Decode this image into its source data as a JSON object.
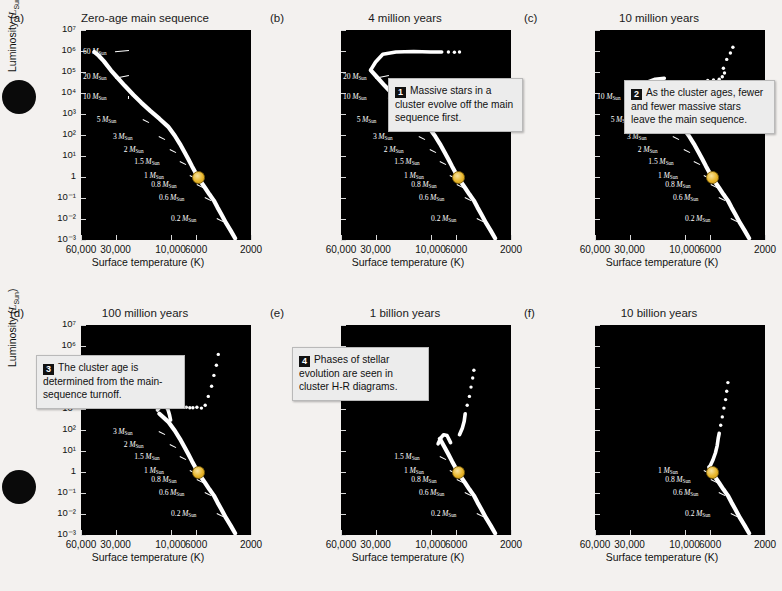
{
  "figure": {
    "axis": {
      "ylabel": "Luminosity (L_Sun)",
      "ylabel_main": "Luminosity (",
      "ylabel_italic": "L",
      "ylabel_sub": "Sun",
      "ylabel_end": ")",
      "xlabel": "Surface temperature (K)",
      "yticks": [
        "10⁷",
        "10⁶",
        "10⁵",
        "10⁴",
        "10³",
        "10²",
        "10¹",
        "1",
        "10⁻¹",
        "10⁻²",
        "10⁻³"
      ],
      "ytick_values": [
        10000000.0,
        1000000.0,
        100000.0,
        10000.0,
        1000.0,
        100.0,
        10,
        1,
        0.1,
        0.01,
        0.001
      ],
      "xticks": [
        "60,000",
        "30,000",
        "10,000",
        "6000",
        "2000"
      ],
      "xtick_values": [
        60000,
        30000,
        10000,
        6000,
        2000
      ],
      "ylim": [
        0.001,
        10000000
      ],
      "xlim": [
        60000,
        2000
      ],
      "xscale": "log-reversed",
      "yscale": "log"
    },
    "panels": [
      {
        "tag": "(a)",
        "title": "Zero-age main sequence",
        "masses": [
          "60",
          "20",
          "10",
          "5",
          "3",
          "2",
          "1.5",
          "1",
          "0.8",
          "0.6",
          "0.2"
        ],
        "has_sun": true,
        "callout": null
      },
      {
        "tag": "(b)",
        "title": "4 million years",
        "masses": [
          "20",
          "10",
          "5",
          "3",
          "2",
          "1.5",
          "1",
          "0.8",
          "0.6",
          "0.2"
        ],
        "has_sun": true,
        "callout": {
          "number": "1",
          "text": "Massive stars in a cluster evolve off the main sequence first."
        }
      },
      {
        "tag": "(c)",
        "title": "10 million years",
        "masses": [
          "10",
          "5",
          "3",
          "2",
          "1.5",
          "1",
          "0.8",
          "0.6",
          "0.2"
        ],
        "has_sun": true,
        "callout": {
          "number": "2",
          "text": "As the cluster ages, fewer and fewer massive stars leave the main sequence."
        }
      },
      {
        "tag": "(d)",
        "title": "100 million years",
        "masses": [
          "3",
          "2",
          "1.5",
          "1",
          "0.8",
          "0.6",
          "0.2"
        ],
        "has_sun": true,
        "callout": {
          "number": "3",
          "text": "The cluster age is determined from the main-sequence turnoff."
        }
      },
      {
        "tag": "(e)",
        "title": "1 billion years",
        "masses": [
          "1.5",
          "1",
          "0.8",
          "0.6",
          "0.2"
        ],
        "has_sun": true,
        "callout": {
          "number": "4",
          "text": "Phases of stellar evolution are seen in cluster H-R diagrams."
        }
      },
      {
        "tag": "(f)",
        "title": "10 billion years",
        "masses": [
          "1",
          "0.8",
          "0.6",
          "0.2"
        ],
        "has_sun": true,
        "callout": null
      }
    ],
    "mass_unit_symbol": "M",
    "mass_unit_sub": "Sun",
    "colors": {
      "plot_background": "#000000",
      "track": "#ffffff",
      "sun_marker": "#e8b62c",
      "page_background": "#f3f1ef",
      "callout_background": "#ececec"
    }
  },
  "chart_data": {
    "type": "line",
    "xlabel": "Surface temperature (K)",
    "ylabel": "Luminosity (L_Sun)",
    "xlim": [
      60000,
      2000
    ],
    "ylim": [
      0.001,
      10000000
    ],
    "xscale": "log-reversed",
    "yscale": "log",
    "grid": false,
    "legend": "none",
    "series": [
      {
        "name": "(a) Zero-age main sequence",
        "points_temp_lum": [
          [
            45000,
            800000
          ],
          [
            40000,
            500000
          ],
          [
            33000,
            90000
          ],
          [
            25000,
            20000
          ],
          [
            18000,
            4000
          ],
          [
            12000,
            600
          ],
          [
            9000,
            80
          ],
          [
            7500,
            20
          ],
          [
            6800,
            5
          ],
          [
            5800,
            1
          ],
          [
            5000,
            0.35
          ],
          [
            4200,
            0.08
          ],
          [
            3400,
            0.01
          ],
          [
            2800,
            0.0015
          ]
        ],
        "mass_labels": [
          {
            "mass": "60",
            "temp": 44000,
            "lum": 700000
          },
          {
            "mass": "20",
            "temp": 33000,
            "lum": 45000
          },
          {
            "mass": "10",
            "temp": 24000,
            "lum": 6000
          },
          {
            "mass": "5",
            "temp": 16000,
            "lum": 500
          },
          {
            "mass": "3",
            "temp": 11500,
            "lum": 70
          },
          {
            "mass": "2",
            "temp": 9000,
            "lum": 16
          },
          {
            "mass": "1.5",
            "temp": 7200,
            "lum": 5
          },
          {
            "mass": "1",
            "temp": 5800,
            "lum": 1
          },
          {
            "mass": "0.8",
            "temp": 5000,
            "lum": 0.35
          },
          {
            "mass": "0.6",
            "temp": 4200,
            "lum": 0.08
          },
          {
            "mass": "0.2",
            "temp": 3300,
            "lum": 0.008
          }
        ],
        "sun": {
          "temp": 5800,
          "lum": 1
        }
      },
      {
        "name": "(b) 4 million years",
        "turnoff_mass": 60,
        "note": "Massive stars evolve off main sequence; supergiant branch extends redward at L~1e6"
      },
      {
        "name": "(c) 10 million years",
        "turnoff_mass": 20,
        "note": "Turnoff at 20 M_Sun; red supergiants populate upper right"
      },
      {
        "name": "(d) 100 million years",
        "turnoff_mass": 5,
        "note": "Turnoff near L~1e3; giant branch visible"
      },
      {
        "name": "(e) 1 billion years",
        "turnoff_mass": 2,
        "note": "Turnoff near L~10; red giant branch visible"
      },
      {
        "name": "(f) 10 billion years",
        "turnoff_mass": 1,
        "note": "Turnoff near L~1; only low-mass stars remain on the main sequence"
      }
    ]
  }
}
